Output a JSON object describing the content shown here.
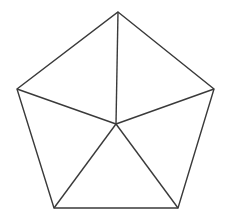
{
  "figure": {
    "name": "pentagon-with-central-spokes",
    "background_color": "#ffffff",
    "stroke_color": "#3a3a3a",
    "stroke_width": 1.4,
    "canvas": {
      "width": 225,
      "height": 219
    },
    "vertices": [
      {
        "id": "apex",
        "label": "top",
        "x": 118,
        "y": 12
      },
      {
        "id": "right",
        "label": "upper-right",
        "x": 214,
        "y": 89
      },
      {
        "id": "bottom-right",
        "label": "lower-right",
        "x": 178,
        "y": 208
      },
      {
        "id": "bottom-left",
        "label": "lower-left",
        "x": 54,
        "y": 208
      },
      {
        "id": "left",
        "label": "upper-left",
        "x": 17,
        "y": 89
      }
    ],
    "center": {
      "id": "center",
      "label": "interior-point",
      "x": 116,
      "y": 124
    },
    "outline_points": "118,12 214,89 178,208 54,208 17,89",
    "spokes": [
      {
        "id": "spoke-apex",
        "x1": 116,
        "y1": 124,
        "x2": 118,
        "y2": 12
      },
      {
        "id": "spoke-right",
        "x1": 116,
        "y1": 124,
        "x2": 214,
        "y2": 89
      },
      {
        "id": "spoke-bottom-right",
        "x1": 116,
        "y1": 124,
        "x2": 178,
        "y2": 208
      },
      {
        "id": "spoke-bottom-left",
        "x1": 116,
        "y1": 124,
        "x2": 54,
        "y2": 208
      },
      {
        "id": "spoke-left",
        "x1": 116,
        "y1": 124,
        "x2": 17,
        "y2": 89
      }
    ],
    "triangle_count": 5
  }
}
